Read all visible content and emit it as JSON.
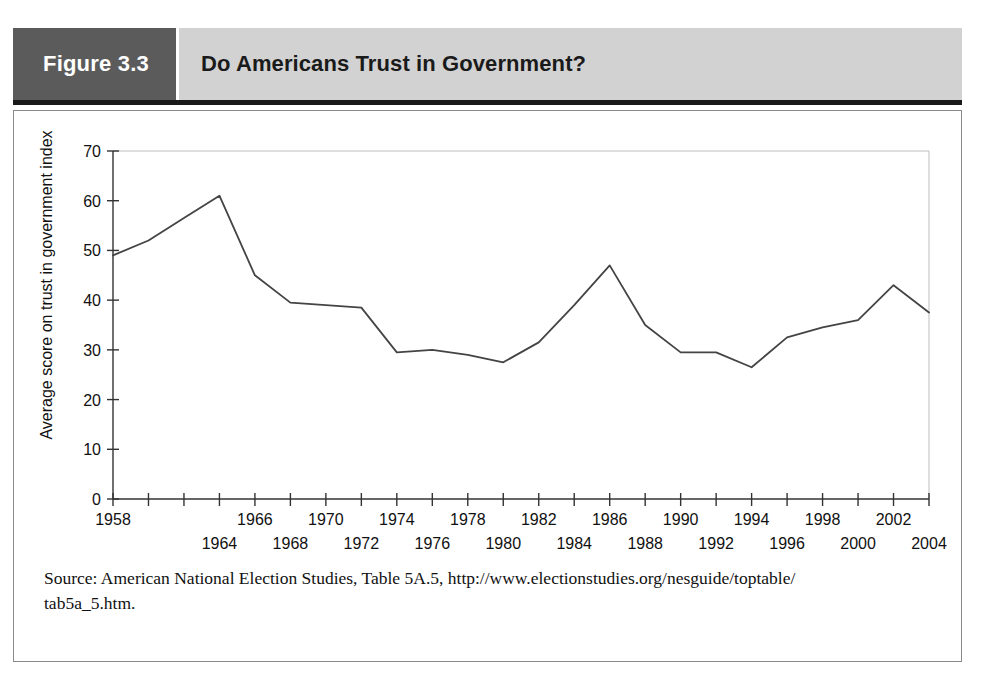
{
  "header": {
    "figure_number": "Figure 3.3",
    "title": "Do Americans Trust in Government?"
  },
  "source": {
    "line1": "Source: American National Election Studies, Table 5A.5, http://www.electionstudies.org/nesguide/toptable/",
    "line2": "tab5a_5.htm."
  },
  "colors": {
    "header_block": "#5b5b5b",
    "header_title_band": "#d2d2d2",
    "rule": "#1a1a1a",
    "line": "#444444",
    "panel_border": "#8a8a8a"
  },
  "chart_data": {
    "type": "line",
    "title": "Do Americans Trust in Government?",
    "xlabel": "",
    "ylabel": "Average score on trust in government index",
    "ylim": [
      0,
      70
    ],
    "ytick_values": [
      0,
      10,
      20,
      30,
      40,
      50,
      60,
      70
    ],
    "ytick_labels": [
      "0",
      "10",
      "20",
      "30",
      "40",
      "50",
      "60",
      "70"
    ],
    "xlim": [
      1958,
      2004
    ],
    "xtick_values": [
      1958,
      1960,
      1962,
      1964,
      1966,
      1968,
      1970,
      1972,
      1974,
      1976,
      1978,
      1980,
      1982,
      1984,
      1986,
      1988,
      1990,
      1992,
      1994,
      1996,
      1998,
      2000,
      2002,
      2004
    ],
    "xtick_labels_top_row": [
      "1958",
      "",
      "",
      "",
      "1966",
      "",
      "1970",
      "",
      "1974",
      "",
      "1978",
      "",
      "1982",
      "",
      "1986",
      "",
      "1990",
      "",
      "1994",
      "",
      "1998",
      "",
      "2002",
      ""
    ],
    "xtick_labels_bottom_row": [
      "",
      "",
      "",
      "1964",
      "",
      "1968",
      "",
      "1972",
      "",
      "1976",
      "",
      "1980",
      "",
      "1984",
      "",
      "1988",
      "",
      "1992",
      "",
      "1996",
      "",
      "2000",
      "",
      "2004"
    ],
    "grid": false,
    "legend": "none",
    "x": [
      1958,
      1960,
      1962,
      1964,
      1966,
      1968,
      1970,
      1972,
      1974,
      1976,
      1978,
      1980,
      1982,
      1984,
      1986,
      1988,
      1990,
      1992,
      1994,
      1996,
      1998,
      2000,
      2002,
      2004
    ],
    "values": [
      49,
      52,
      56.5,
      61,
      45,
      39.5,
      39,
      38.5,
      29.5,
      30,
      29,
      27.5,
      31.5,
      39,
      47,
      35,
      29.5,
      29.5,
      26.5,
      32.5,
      34.5,
      36,
      43,
      37.5
    ],
    "series": [
      {
        "name": "Average score on trust in government index",
        "values": [
          49,
          52,
          56.5,
          61,
          45,
          39.5,
          39,
          38.5,
          29.5,
          30,
          29,
          27.5,
          31.5,
          39,
          47,
          35,
          29.5,
          29.5,
          26.5,
          32.5,
          34.5,
          36,
          43,
          37.5
        ]
      }
    ]
  }
}
